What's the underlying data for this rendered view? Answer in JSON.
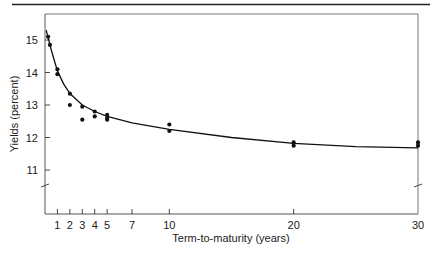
{
  "chart_data": {
    "type": "scatter",
    "title": "",
    "xlabel": "Term-to-maturity (years)",
    "ylabel": "Yields (percent)",
    "xlim": [
      0,
      30
    ],
    "ylim": [
      10,
      15.5
    ],
    "x_ticks": [
      1,
      2,
      3,
      4,
      5,
      7,
      10,
      20,
      30
    ],
    "y_ticks": [
      11,
      12,
      13,
      14,
      15
    ],
    "y_axis_break": true,
    "grid": false,
    "legend": null,
    "series": [
      {
        "name": "Observed yields",
        "kind": "scatter",
        "points": [
          {
            "x": 0.25,
            "y": 15.1
          },
          {
            "x": 0.4,
            "y": 14.85
          },
          {
            "x": 1,
            "y": 14.1
          },
          {
            "x": 1,
            "y": 13.95
          },
          {
            "x": 2,
            "y": 13.35
          },
          {
            "x": 2,
            "y": 13.0
          },
          {
            "x": 3,
            "y": 12.95
          },
          {
            "x": 3,
            "y": 12.55
          },
          {
            "x": 4,
            "y": 12.8
          },
          {
            "x": 4,
            "y": 12.65
          },
          {
            "x": 5,
            "y": 12.7
          },
          {
            "x": 5,
            "y": 12.6
          },
          {
            "x": 5,
            "y": 12.55
          },
          {
            "x": 10,
            "y": 12.4
          },
          {
            "x": 10,
            "y": 12.2
          },
          {
            "x": 20,
            "y": 11.85
          },
          {
            "x": 20,
            "y": 11.75
          },
          {
            "x": 30,
            "y": 11.85
          },
          {
            "x": 30,
            "y": 11.75
          }
        ]
      },
      {
        "name": "Fitted yield curve",
        "kind": "line",
        "points": [
          {
            "x": 0.1,
            "y": 15.3
          },
          {
            "x": 0.5,
            "y": 14.7
          },
          {
            "x": 1,
            "y": 14.05
          },
          {
            "x": 1.5,
            "y": 13.65
          },
          {
            "x": 2,
            "y": 13.35
          },
          {
            "x": 3,
            "y": 13.0
          },
          {
            "x": 4,
            "y": 12.8
          },
          {
            "x": 5,
            "y": 12.65
          },
          {
            "x": 7,
            "y": 12.45
          },
          {
            "x": 10,
            "y": 12.25
          },
          {
            "x": 15,
            "y": 12.0
          },
          {
            "x": 20,
            "y": 11.82
          },
          {
            "x": 25,
            "y": 11.72
          },
          {
            "x": 30,
            "y": 11.68
          }
        ]
      }
    ]
  },
  "labels": {
    "xlabel": "Term-to-maturity (years)",
    "ylabel": "Yields (percent)",
    "x_tick_labels": [
      "1",
      "2",
      "3",
      "4",
      "5",
      "7",
      "10",
      "20",
      "30"
    ],
    "y_tick_labels": [
      "11",
      "12",
      "13",
      "14",
      "15"
    ]
  },
  "colors": {
    "ink": "#111111",
    "frame": "#555555",
    "background": "#ffffff"
  }
}
